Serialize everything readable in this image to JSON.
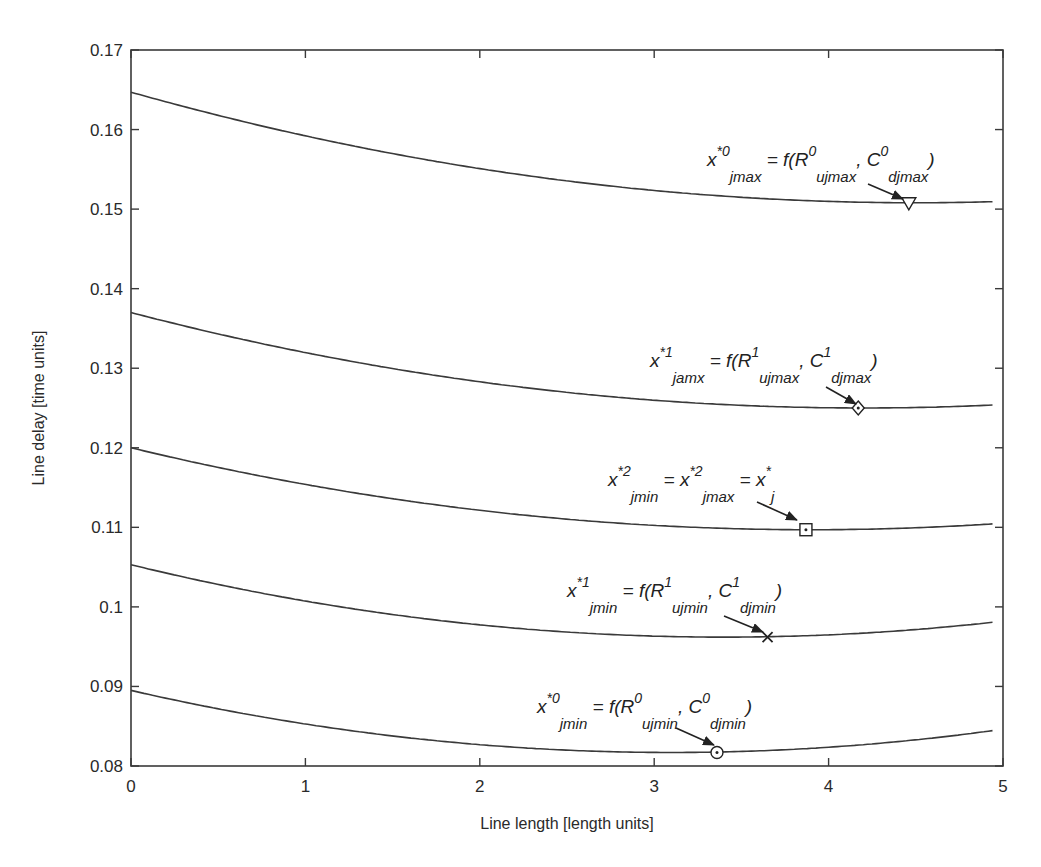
{
  "chart_data": {
    "type": "line",
    "title": "",
    "xlabel": "Line length [length units]",
    "ylabel": "Line delay [time units]",
    "xlim": [
      0,
      5
    ],
    "ylim": [
      0.08,
      0.17
    ],
    "xticks": [
      0,
      1,
      2,
      3,
      4,
      5
    ],
    "xtick_labels": [
      "0",
      "1",
      "2",
      "3",
      "4",
      "5"
    ],
    "yticks": [
      0.08,
      0.09,
      0.1,
      0.11,
      0.12,
      0.13,
      0.14,
      0.15,
      0.16,
      0.17
    ],
    "ytick_labels": [
      "0.08",
      "0.09",
      "0.1",
      "0.11",
      "0.12",
      "0.13",
      "0.14",
      "0.15",
      "0.16",
      "0.17"
    ],
    "grid": false,
    "legend": null,
    "line_color": "#3a3a3a",
    "series": [
      {
        "name": "curve-0-max",
        "x_end": 4.94,
        "y_start": 0.1647,
        "min_x": 4.5,
        "min_y": 0.1508,
        "x": [
          0,
          0.5,
          1,
          1.5,
          2,
          2.5,
          3,
          3.5,
          4,
          4.5,
          4.94
        ],
        "values": [
          0.1647,
          0.1618,
          0.1591,
          0.157,
          0.1551,
          0.1535,
          0.1523,
          0.1514,
          0.151,
          0.1508,
          0.1509
        ]
      },
      {
        "name": "curve-1-max",
        "x_end": 4.94,
        "y_start": 0.137,
        "min_x": 4.2,
        "min_y": 0.125,
        "x": [
          0,
          0.5,
          1,
          1.5,
          2,
          2.5,
          3,
          3.5,
          4,
          4.5,
          4.94
        ],
        "values": [
          0.137,
          0.1343,
          0.132,
          0.13,
          0.1283,
          0.127,
          0.126,
          0.1253,
          0.125,
          0.1251,
          0.1254
        ]
      },
      {
        "name": "curve-2",
        "x_end": 4.94,
        "y_start": 0.12,
        "min_x": 3.9,
        "min_y": 0.1097,
        "x": [
          0,
          0.5,
          1,
          1.5,
          2,
          2.5,
          3,
          3.5,
          4,
          4.5,
          4.94
        ],
        "values": [
          0.12,
          0.1175,
          0.1154,
          0.1136,
          0.1121,
          0.111,
          0.1102,
          0.1098,
          0.1097,
          0.1099,
          0.1104
        ]
      },
      {
        "name": "curve-1-min",
        "x_end": 4.94,
        "y_start": 0.1053,
        "min_x": 3.4,
        "min_y": 0.0962,
        "x": [
          0,
          0.5,
          1,
          1.5,
          2,
          2.5,
          3,
          3.5,
          4,
          4.5,
          4.94
        ],
        "values": [
          0.1053,
          0.1028,
          0.1007,
          0.099,
          0.0977,
          0.0968,
          0.0963,
          0.0962,
          0.0965,
          0.0971,
          0.0978
        ]
      },
      {
        "name": "curve-0-min",
        "x_end": 4.94,
        "y_start": 0.0895,
        "min_x": 3.1,
        "min_y": 0.0817,
        "x": [
          0,
          0.5,
          1,
          1.5,
          2,
          2.5,
          3,
          3.5,
          4,
          4.5,
          4.94
        ],
        "values": [
          0.0895,
          0.0872,
          0.0853,
          0.0838,
          0.0827,
          0.082,
          0.0817,
          0.0818,
          0.0824,
          0.0833,
          0.0841
        ]
      }
    ],
    "markers": [
      {
        "series": "curve-0-max",
        "shape": "triangle-down",
        "x": 4.46,
        "y": 0.1508
      },
      {
        "series": "curve-1-max",
        "shape": "diamond",
        "x": 4.17,
        "y": 0.125
      },
      {
        "series": "curve-2",
        "shape": "square-dot",
        "x": 3.87,
        "y": 0.1097
      },
      {
        "series": "curve-1-min",
        "shape": "x",
        "x": 3.65,
        "y": 0.0962
      },
      {
        "series": "curve-0-min",
        "shape": "circle-dot",
        "x": 3.36,
        "y": 0.0817
      }
    ],
    "annotations": [
      {
        "id": "a1",
        "text": "x*0_jmax = f(R0_ujmax, C0_djmax)",
        "parts": [
          [
            "x",
            ""
          ],
          [
            "*0",
            "sup"
          ],
          [
            "jmax",
            "sub"
          ],
          [
            " = f(R",
            ""
          ],
          [
            "0",
            "sup"
          ],
          [
            "ujmax",
            "sub"
          ],
          [
            ", C",
            ""
          ],
          [
            "0",
            "sup"
          ],
          [
            "djmax",
            "sub"
          ],
          [
            ")",
            ""
          ]
        ],
        "label_px": [
          707,
          166
        ],
        "arrow_px": [
          [
            868,
            184
          ],
          [
            903,
            199
          ]
        ]
      },
      {
        "id": "a2",
        "text": "x*1_jamx = f(R1_ujmax, C1_djmax)",
        "parts": [
          [
            "x",
            ""
          ],
          [
            "*1",
            "sup"
          ],
          [
            "jamx",
            "sub"
          ],
          [
            " = f(R",
            ""
          ],
          [
            "1",
            "sup"
          ],
          [
            "ujmax",
            "sub"
          ],
          [
            ", C",
            ""
          ],
          [
            "1",
            "sup"
          ],
          [
            "djmax",
            "sub"
          ],
          [
            ")",
            ""
          ]
        ],
        "label_px": [
          650,
          367
        ],
        "arrow_px": [
          [
            826,
            387
          ],
          [
            856,
            404
          ]
        ]
      },
      {
        "id": "a3",
        "text": "x*2_jmin = x*2_jmax = x*_j",
        "parts": [
          [
            "x",
            ""
          ],
          [
            "*2",
            "sup"
          ],
          [
            "jmin",
            "sub"
          ],
          [
            " = x",
            ""
          ],
          [
            "*2",
            "sup"
          ],
          [
            "jmax",
            "sub"
          ],
          [
            " = x",
            ""
          ],
          [
            "*",
            "sup"
          ],
          [
            "j",
            "sub"
          ]
        ],
        "label_px": [
          608,
          486
        ],
        "arrow_px": [
          [
            757,
            502
          ],
          [
            797,
            520
          ]
        ]
      },
      {
        "id": "a4",
        "text": "x*1_jmin = f(R1_ujmin, C1_djmin)",
        "parts": [
          [
            "x",
            ""
          ],
          [
            "*1",
            "sup"
          ],
          [
            "jmin",
            "sub"
          ],
          [
            " = f(R",
            ""
          ],
          [
            "1",
            "sup"
          ],
          [
            "ujmin",
            "sub"
          ],
          [
            ", C",
            ""
          ],
          [
            "1",
            "sup"
          ],
          [
            "djmin",
            "sub"
          ],
          [
            ")",
            ""
          ]
        ],
        "label_px": [
          567,
          597
        ],
        "arrow_px": [
          [
            724,
            616
          ],
          [
            763,
            632
          ]
        ]
      },
      {
        "id": "a5",
        "text": "x*0_jmin = f(R0_ujmin, C0_djmin)",
        "parts": [
          [
            "x",
            ""
          ],
          [
            "*0",
            "sup"
          ],
          [
            "jmin",
            "sub"
          ],
          [
            " = f(R",
            ""
          ],
          [
            "0",
            "sup"
          ],
          [
            "ujmin",
            "sub"
          ],
          [
            ", C",
            ""
          ],
          [
            "0",
            "sup"
          ],
          [
            "djmin",
            "sub"
          ],
          [
            ")",
            ""
          ]
        ],
        "label_px": [
          537,
          713
        ],
        "arrow_px": [
          [
            676,
            728
          ],
          [
            714,
            745
          ]
        ]
      }
    ]
  },
  "plot_area_px": {
    "left": 131,
    "top": 50,
    "right": 1003,
    "bottom": 766
  }
}
